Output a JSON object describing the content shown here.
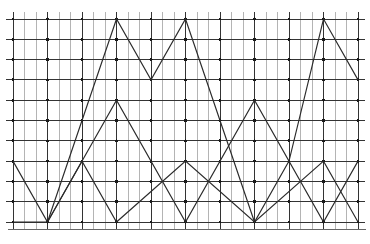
{
  "figure": {
    "width": 370,
    "height": 244,
    "background_color": "#ffffff"
  },
  "chart_data": {
    "type": "line",
    "title": "",
    "subtitle": "",
    "xlabel": "",
    "ylabel": "",
    "xlim": [
      0,
      30
    ],
    "ylim": [
      0,
      10
    ],
    "grid": true,
    "grid_style": "dotted-intersections",
    "legend_position": "none",
    "x_tick_labels": [],
    "y_tick_labels": [],
    "annotations": [],
    "series": [
      {
        "name": "wave-large-amplitude",
        "amplitude": 10,
        "period": 12,
        "baseline": 0,
        "peak": 10,
        "color": "#2b2b2b",
        "points": [
          [
            0,
            3
          ],
          [
            3,
            0
          ],
          [
            9,
            10
          ],
          [
            12,
            7
          ],
          [
            15,
            10
          ],
          [
            21,
            0
          ],
          [
            24,
            3
          ],
          [
            27,
            10
          ],
          [
            30,
            7
          ]
        ]
      },
      {
        "name": "wave-medium-amplitude",
        "amplitude": 6,
        "period": 12,
        "baseline": 0,
        "peak": 6,
        "color": "#2b2b2b",
        "points": [
          [
            0,
            0
          ],
          [
            3,
            0
          ],
          [
            9,
            6
          ],
          [
            15,
            0
          ],
          [
            21,
            6
          ],
          [
            27,
            0
          ],
          [
            30,
            3
          ]
        ]
      },
      {
        "name": "wave-small-amplitude",
        "amplitude": 3,
        "period": 12,
        "baseline": 0,
        "peak": 3,
        "color": "#2b2b2b",
        "points": [
          [
            3,
            0
          ],
          [
            6,
            3
          ],
          [
            9,
            0
          ],
          [
            15,
            3
          ],
          [
            21,
            0
          ],
          [
            27,
            3
          ],
          [
            30,
            0
          ]
        ]
      }
    ]
  },
  "grid": {
    "color_major": "#333333",
    "color_minor": "#b4b4b4",
    "dot_color": "#1a1a1a",
    "dot_radius": 1.6,
    "vertical_line_count": 31,
    "horizontal_line_count": 11,
    "x_start": 13,
    "x_step": 11.5,
    "y_start": 19,
    "y_step": 20.3,
    "baseline_color": "#555555"
  }
}
